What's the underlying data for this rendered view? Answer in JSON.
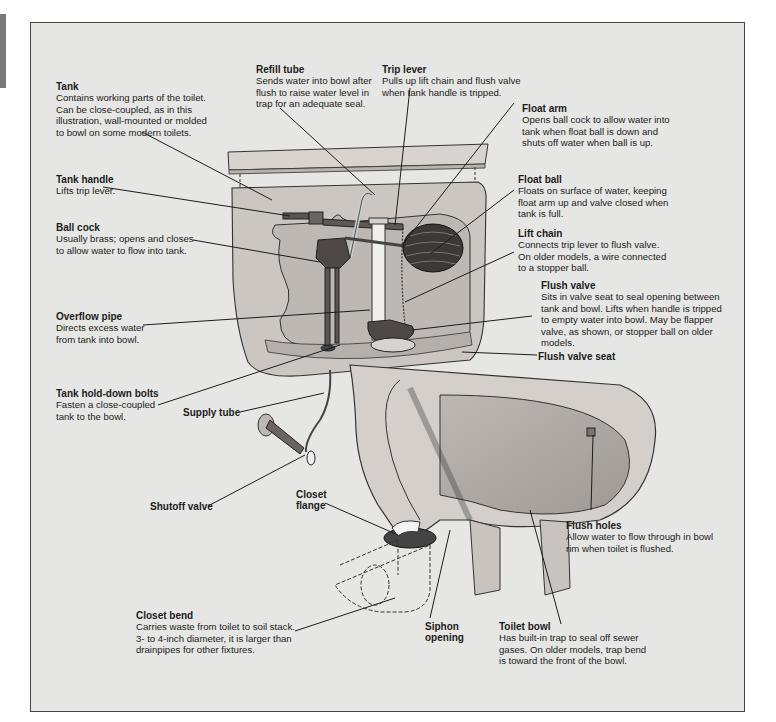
{
  "diagram": {
    "colors": {
      "background": "#e6e6e4",
      "frame_border": "#444444",
      "porcelain": "#cfcac6",
      "fixture_dark": "#4e4846",
      "text": "#1c1c1c"
    },
    "labels": {
      "tank": {
        "title": "Tank",
        "desc": "Contains working parts of the toilet.\nCan be close-coupled, as in this\nillustration, wall-mounted or molded\nto bowl on some modern toilets."
      },
      "refill_tube": {
        "title": "Refill tube",
        "desc": "Sends water into bowl after\nflush to raise water level in\ntrap for an adequate seal."
      },
      "trip_lever": {
        "title": "Trip lever",
        "desc": "Pulls up lift chain and flush valve\nwhen tank handle is tripped."
      },
      "float_arm": {
        "title": "Float arm",
        "desc": "Opens ball cock to allow water into\ntank when float ball is down and\nshuts off water when ball is up."
      },
      "tank_handle": {
        "title": "Tank handle",
        "desc": "Lifts trip lever."
      },
      "float_ball": {
        "title": "Float ball",
        "desc": "Floats on surface of water, keeping\nfloat arm up and valve closed when\ntank is full."
      },
      "ball_cock": {
        "title": "Ball cock",
        "desc": "Usually brass; opens and closes\nto allow water to flow into tank."
      },
      "lift_chain": {
        "title": "Lift chain",
        "desc": "Connects trip lever to flush valve.\nOn older models, a wire connected\nto a stopper ball."
      },
      "overflow_pipe": {
        "title": "Overflow pipe",
        "desc": "Directs excess water\nfrom tank into bowl."
      },
      "flush_valve": {
        "title": "Flush valve",
        "desc": "Sits in valve seat to seal opening between\ntank and bowl. Lifts when handle is tripped\nto empty water into bowl. May be flapper\nvalve, as shown, or stopper ball on older\nmodels."
      },
      "flush_valve_seat": {
        "title": "Flush valve seat"
      },
      "tank_hold_down_bolts": {
        "title": "Tank hold-down bolts",
        "desc": "Fasten a close-coupled\ntank to the bowl."
      },
      "supply_tube": {
        "title": "Supply tube"
      },
      "shutoff_valve": {
        "title": "Shutoff valve"
      },
      "closet_flange": {
        "title": "Closet\nflange"
      },
      "flush_holes": {
        "title": "Flush holes",
        "desc": "Allow water to flow through in bowl\nrim when toilet is flushed."
      },
      "closet_bend": {
        "title": "Closet bend",
        "desc": "Carries waste from toilet to soil stack.\n3- to 4-inch diameter, it is larger than\ndrainpipes for other fixtures."
      },
      "siphon_opening": {
        "title": "Siphon\nopening"
      },
      "toilet_bowl": {
        "title": "Toilet bowl",
        "desc": "Has built-in trap to seal off sewer\ngases. On older models, trap bend\nis toward the front of the bowl."
      }
    }
  }
}
